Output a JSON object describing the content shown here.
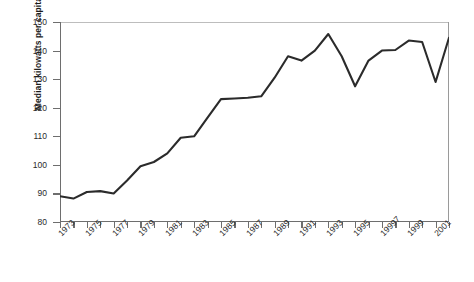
{
  "chart_data": {
    "type": "line",
    "title": "",
    "xlabel": "",
    "ylabel": "Median kilowatts per capita in Africa",
    "ylim": [
      80,
      150
    ],
    "ytick_values": [
      80,
      90,
      100,
      110,
      120,
      130,
      140,
      150
    ],
    "ytick_labels": [
      "80",
      "90",
      "100",
      "110",
      "120",
      "130",
      "140",
      "150"
    ],
    "xlim": [
      1973,
      2002
    ],
    "xtick_values": [
      1973,
      1974,
      1975,
      1976,
      1977,
      1978,
      1979,
      1980,
      1981,
      1982,
      1983,
      1984,
      1985,
      1986,
      1987,
      1988,
      1989,
      1990,
      1991,
      1992,
      1993,
      1994,
      1995,
      1996,
      1997,
      1998,
      1999,
      2000,
      2001,
      2002
    ],
    "xtick_labels_shown": [
      "1973",
      "1975",
      "1977",
      "1979",
      "1981",
      "1983",
      "1985",
      "1987",
      "1989",
      "1991",
      "1993",
      "1995",
      "19997",
      "1999",
      "2001"
    ],
    "xtick_labels_shown_values": [
      1973,
      1975,
      1977,
      1979,
      1981,
      1983,
      1985,
      1987,
      1989,
      1991,
      1993,
      1995,
      1997,
      1999,
      2001
    ],
    "grid": false,
    "legend": false,
    "legend_position": "none",
    "line_color": "#2b2b2b",
    "axis_color": "#6e6e6e",
    "background_color": "#ffffff",
    "x": [
      1973,
      1974,
      1975,
      1976,
      1977,
      1978,
      1979,
      1980,
      1981,
      1982,
      1983,
      1984,
      1985,
      1986,
      1987,
      1988,
      1989,
      1990,
      1991,
      1992,
      1993,
      1994,
      1995,
      1996,
      1997,
      1998,
      1999,
      2000,
      2001,
      2002
    ],
    "values": [
      89.0,
      88.2,
      90.5,
      90.8,
      90.0,
      94.5,
      99.5,
      101.0,
      104.0,
      109.5,
      110.0,
      116.5,
      123.0,
      123.2,
      123.5,
      124.0,
      130.5,
      138.0,
      136.5,
      140.0,
      145.8,
      138.0,
      127.5,
      136.5,
      140.0,
      140.2,
      143.5,
      143.0,
      129.0,
      144.5
    ],
    "series": [
      {
        "name": "Median kilowatts per capita in Africa",
        "values": [
          89.0,
          88.2,
          90.5,
          90.8,
          90.0,
          94.5,
          99.5,
          101.0,
          104.0,
          109.5,
          110.0,
          116.5,
          123.0,
          123.2,
          123.5,
          124.0,
          130.5,
          138.0,
          136.5,
          140.0,
          145.8,
          138.0,
          127.5,
          136.5,
          140.0,
          140.2,
          143.5,
          143.0,
          129.0,
          144.5
        ]
      }
    ]
  }
}
